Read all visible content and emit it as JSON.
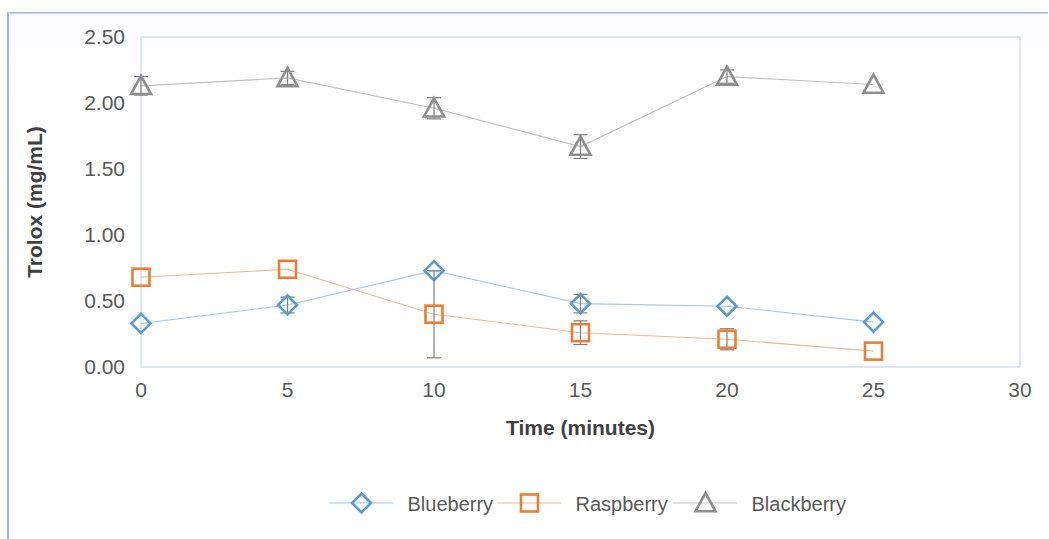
{
  "chart_data": {
    "type": "line",
    "title": "",
    "subtitle": "",
    "xlabel": "Time (minutes)",
    "ylabel": "Trolox (mg/mL)",
    "x": [
      0,
      5,
      10,
      15,
      20,
      25
    ],
    "xlim": [
      0,
      30
    ],
    "ylim": [
      0,
      2.5
    ],
    "xticks": [
      "0",
      "5",
      "10",
      "15",
      "20",
      "25",
      "30"
    ],
    "xtick_values": [
      0,
      5,
      10,
      15,
      20,
      25,
      30
    ],
    "yticks": [
      "0.00",
      "0.50",
      "1.00",
      "1.50",
      "2.00",
      "2.50"
    ],
    "ytick_values": [
      0,
      0.5,
      1.0,
      1.5,
      2.0,
      2.5
    ],
    "grid": false,
    "legend_position": "bottom",
    "series": [
      {
        "name": "Blueberry",
        "color": "#5B9BD5",
        "marker": "diamond",
        "values": [
          0.33,
          0.47,
          0.73,
          0.48,
          0.46,
          0.34
        ],
        "errors": [
          0.0,
          0.06,
          0.0,
          0.07,
          0.0,
          0.0
        ]
      },
      {
        "name": "Raspberry",
        "color": "#ED7D31",
        "marker": "square",
        "values": [
          0.68,
          0.74,
          0.4,
          0.26,
          0.21,
          0.12
        ],
        "errors": [
          0.0,
          0.0,
          0.33,
          0.09,
          0.08,
          0.0
        ]
      },
      {
        "name": "Blackberry",
        "color": "#8E8E8E",
        "marker": "triangle",
        "values": [
          2.13,
          2.19,
          1.96,
          1.67,
          2.2,
          2.14
        ],
        "errors": [
          0.07,
          0.05,
          0.08,
          0.09,
          0.05,
          0.0
        ]
      }
    ]
  },
  "legend": {
    "items": [
      {
        "label": "Blueberry",
        "color": "#5B9BD5",
        "marker": "diamond"
      },
      {
        "label": "Raspberry",
        "color": "#ED7D31",
        "marker": "square"
      },
      {
        "label": "Blackberry",
        "color": "#8E8E8E",
        "marker": "triangle"
      }
    ]
  },
  "axes": {
    "x_title": "Time (minutes)",
    "y_title": "Trolox (mg/mL)"
  }
}
